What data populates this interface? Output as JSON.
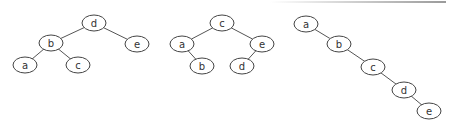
{
  "trees": [
    {
      "id": "tree-1",
      "nodes": [
        {
          "label": "d",
          "x": 94,
          "y": 23
        },
        {
          "label": "b",
          "x": 51,
          "y": 43
        },
        {
          "label": "e",
          "x": 137,
          "y": 44
        },
        {
          "label": "a",
          "x": 25,
          "y": 65
        },
        {
          "label": "c",
          "x": 78,
          "y": 65
        }
      ],
      "edges": [
        [
          "d",
          "b"
        ],
        [
          "d",
          "e"
        ],
        [
          "b",
          "a"
        ],
        [
          "b",
          "c"
        ]
      ]
    },
    {
      "id": "tree-2",
      "nodes": [
        {
          "label": "c",
          "x": 222,
          "y": 23
        },
        {
          "label": "a",
          "x": 182,
          "y": 44
        },
        {
          "label": "e",
          "x": 262,
          "y": 44
        },
        {
          "label": "b",
          "x": 202,
          "y": 66
        },
        {
          "label": "d",
          "x": 242,
          "y": 66
        }
      ],
      "edges": [
        [
          "c",
          "a"
        ],
        [
          "c",
          "e"
        ],
        [
          "a",
          "b"
        ],
        [
          "e",
          "d"
        ]
      ]
    },
    {
      "id": "tree-3",
      "nodes": [
        {
          "label": "a",
          "x": 306,
          "y": 24
        },
        {
          "label": "b",
          "x": 339,
          "y": 44
        },
        {
          "label": "c",
          "x": 373,
          "y": 67
        },
        {
          "label": "d",
          "x": 404,
          "y": 90
        },
        {
          "label": "e",
          "x": 429,
          "y": 111
        }
      ],
      "edges": [
        [
          "a",
          "b"
        ],
        [
          "b",
          "c"
        ],
        [
          "c",
          "d"
        ],
        [
          "d",
          "e"
        ]
      ]
    }
  ],
  "style": {
    "node_rx": 12,
    "node_ry": 8,
    "stroke": "#444444",
    "background": "#ffffff"
  }
}
